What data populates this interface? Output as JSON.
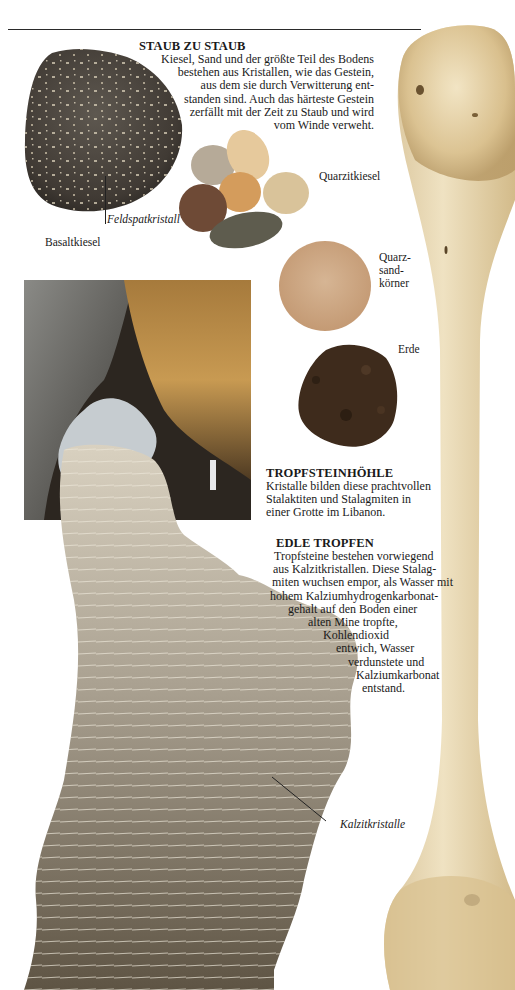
{
  "page": {
    "sections": [
      {
        "id": "staub-zu-staub",
        "heading": "STAUB ZU STAUB",
        "lines": [
          "Kiesel, Sand und der größte Teil des Bodens",
          "bestehen aus Kristallen, wie das Gestein,",
          "aus dem sie durch Verwitterung ent-",
          "standen sind. Auch das härteste Gestein",
          "zerfällt mit der Zeit zu Staub und wird",
          "vom Winde verweht."
        ]
      },
      {
        "id": "tropfsteinhoehle",
        "heading": "TROPFSTEINHÖHLE",
        "lines": [
          "Kristalle bilden diese prachtvollen",
          "Stalaktiten und Stalagmiten in",
          "einer Grotte im Libanon."
        ]
      },
      {
        "id": "edle-tropfen",
        "heading": "EDLE TROPFEN",
        "lines": [
          "Tropfsteine bestehen vorwiegend",
          "aus Kalzitkristallen. Diese Stalag-",
          "miten wuchsen empor, als Wasser mit",
          "hohem Kalziumhydrogenkarbonat-",
          "gehalt auf den Boden einer",
          "alten Mine tropfte,",
          "Kohlendioxid",
          "entwich, Wasser",
          "verdunstete und",
          "Kalziumkarbonat",
          "entstand."
        ]
      }
    ],
    "labels": {
      "feldspatkristall": "Feldspatkristall",
      "basaltkiesel": "Basaltkiesel",
      "quarzitkiesel": "Quarzitkiesel",
      "quarzsand": [
        "Quarz-",
        "sand-",
        "körner"
      ],
      "erde": "Erde",
      "kalzitkristalle": "Kalzitkristalle"
    },
    "images": {
      "basalt_pebble": "basalt-pebble-photo",
      "quartzite_pebbles": "quartzite-pebbles-photo",
      "quartz_sand": "quartz-sand-photo",
      "soil": "soil-photo",
      "cave": "dripstone-cave-photo",
      "calcite": "calcite-crystals-photo",
      "bone": "bone-photo"
    }
  }
}
